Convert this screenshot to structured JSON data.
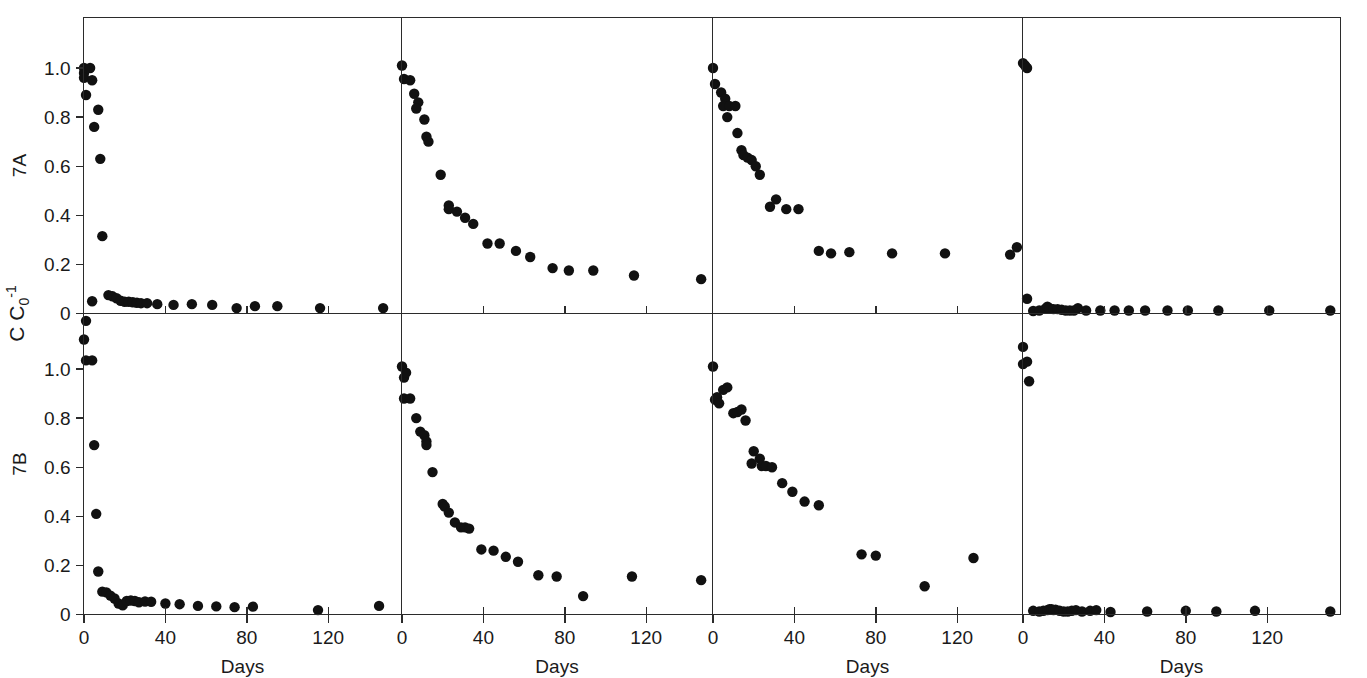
{
  "figure": {
    "y_axis_label": "C C",
    "y_axis_label_sub": "0",
    "y_axis_label_sup": "-1",
    "x_axis_label": "Days",
    "row_labels": [
      "7A",
      "7B"
    ],
    "background_color": "#ffffff",
    "point_color": "#111111",
    "axis_color": "#2b2b2b"
  },
  "chart_data": {
    "type": "scatter",
    "title": "",
    "xlabel": "Days",
    "ylabel": "C C0-1",
    "grid": false,
    "legend": "none",
    "layout": {
      "rows": 2,
      "cols": 4,
      "row_names": [
        "7A",
        "7B"
      ],
      "shared_y_axis": true,
      "shared_x_label": "Days"
    },
    "y_ticks": [
      0,
      0.2,
      0.4,
      0.6,
      0.8,
      1.0
    ],
    "y_tick_labels": [
      "0",
      "0.2",
      "0.4",
      "0.6",
      "0.8",
      "1.0"
    ],
    "ylim": [
      -0.06,
      1.14
    ],
    "x_ticks_panels": [
      [
        0,
        40,
        80,
        120
      ],
      [
        0,
        40,
        80,
        120
      ],
      [
        0,
        40,
        80,
        120
      ],
      [
        0,
        40,
        80,
        120,
        160
      ]
    ],
    "x_tick_labels_panels": [
      [
        "0",
        "40",
        "80",
        "120"
      ],
      [
        "0",
        "40",
        "80",
        "120"
      ],
      [
        "0",
        "40",
        "80",
        "120"
      ],
      [
        "0",
        "40",
        "80",
        "120",
        "160"
      ]
    ],
    "xlim": [
      -4,
      152
    ],
    "panels": [
      {
        "row": "7A",
        "col": 1,
        "points": [
          {
            "x": 0,
            "y": 1.0
          },
          {
            "x": 0,
            "y": 0.98
          },
          {
            "x": 0,
            "y": 0.96
          },
          {
            "x": 1,
            "y": 0.89
          },
          {
            "x": 3,
            "y": 1.0
          },
          {
            "x": 4,
            "y": 0.95
          },
          {
            "x": 7,
            "y": 0.83
          },
          {
            "x": 5,
            "y": 0.76
          },
          {
            "x": 8,
            "y": 0.63
          },
          {
            "x": 9,
            "y": 0.315
          },
          {
            "x": 4,
            "y": 0.05
          },
          {
            "x": 12,
            "y": 0.075
          },
          {
            "x": 14,
            "y": 0.07
          },
          {
            "x": 16,
            "y": 0.062
          },
          {
            "x": 18,
            "y": 0.052
          },
          {
            "x": 20,
            "y": 0.048
          },
          {
            "x": 22,
            "y": 0.048
          },
          {
            "x": 24,
            "y": 0.046
          },
          {
            "x": 26,
            "y": 0.044
          },
          {
            "x": 28,
            "y": 0.042
          },
          {
            "x": 31,
            "y": 0.042
          },
          {
            "x": 36,
            "y": 0.038
          },
          {
            "x": 44,
            "y": 0.035
          },
          {
            "x": 53,
            "y": 0.038
          },
          {
            "x": 63,
            "y": 0.035
          },
          {
            "x": 75,
            "y": 0.022
          },
          {
            "x": 84,
            "y": 0.03
          },
          {
            "x": 95,
            "y": 0.03
          },
          {
            "x": 116,
            "y": 0.022
          },
          {
            "x": 147,
            "y": 0.022
          },
          {
            "x": 1,
            "y": -0.03
          }
        ]
      },
      {
        "row": "7A",
        "col": 2,
        "points": [
          {
            "x": 0,
            "y": 1.01
          },
          {
            "x": 1,
            "y": 0.955
          },
          {
            "x": 4,
            "y": 0.95
          },
          {
            "x": 6,
            "y": 0.895
          },
          {
            "x": 8,
            "y": 0.86
          },
          {
            "x": 7,
            "y": 0.835
          },
          {
            "x": 11,
            "y": 0.79
          },
          {
            "x": 12,
            "y": 0.72
          },
          {
            "x": 13,
            "y": 0.7
          },
          {
            "x": 19,
            "y": 0.565
          },
          {
            "x": 23,
            "y": 0.44
          },
          {
            "x": 23,
            "y": 0.425
          },
          {
            "x": 27,
            "y": 0.415
          },
          {
            "x": 31,
            "y": 0.39
          },
          {
            "x": 35,
            "y": 0.365
          },
          {
            "x": 42,
            "y": 0.285
          },
          {
            "x": 48,
            "y": 0.285
          },
          {
            "x": 56,
            "y": 0.255
          },
          {
            "x": 63,
            "y": 0.23
          },
          {
            "x": 74,
            "y": 0.185
          },
          {
            "x": 82,
            "y": 0.175
          },
          {
            "x": 94,
            "y": 0.175
          },
          {
            "x": 114,
            "y": 0.155
          },
          {
            "x": 147,
            "y": 0.14
          }
        ]
      },
      {
        "row": "7A",
        "col": 3,
        "points": [
          {
            "x": 0,
            "y": 1.0
          },
          {
            "x": 1,
            "y": 0.935
          },
          {
            "x": 4,
            "y": 0.9
          },
          {
            "x": 6,
            "y": 0.875
          },
          {
            "x": 5,
            "y": 0.845
          },
          {
            "x": 8,
            "y": 0.845
          },
          {
            "x": 11,
            "y": 0.845
          },
          {
            "x": 7,
            "y": 0.8
          },
          {
            "x": 12,
            "y": 0.735
          },
          {
            "x": 14,
            "y": 0.665
          },
          {
            "x": 15,
            "y": 0.645
          },
          {
            "x": 17,
            "y": 0.635
          },
          {
            "x": 19,
            "y": 0.625
          },
          {
            "x": 21,
            "y": 0.6
          },
          {
            "x": 23,
            "y": 0.565
          },
          {
            "x": 28,
            "y": 0.435
          },
          {
            "x": 31,
            "y": 0.465
          },
          {
            "x": 36,
            "y": 0.425
          },
          {
            "x": 42,
            "y": 0.425
          },
          {
            "x": 52,
            "y": 0.255
          },
          {
            "x": 58,
            "y": 0.245
          },
          {
            "x": 67,
            "y": 0.25
          },
          {
            "x": 88,
            "y": 0.245
          },
          {
            "x": 114,
            "y": 0.245
          },
          {
            "x": 146,
            "y": 0.24
          }
        ]
      },
      {
        "row": "7A",
        "col": 4,
        "points": [
          {
            "x": 0,
            "y": 1.02
          },
          {
            "x": 1,
            "y": 1.01
          },
          {
            "x": 2,
            "y": 1.0
          },
          {
            "x": -3,
            "y": 0.27
          },
          {
            "x": 2,
            "y": 0.06
          },
          {
            "x": 5,
            "y": 0.01
          },
          {
            "x": 8,
            "y": 0.012
          },
          {
            "x": 11,
            "y": 0.02
          },
          {
            "x": 12,
            "y": 0.028
          },
          {
            "x": 13,
            "y": 0.022
          },
          {
            "x": 15,
            "y": 0.018
          },
          {
            "x": 17,
            "y": 0.018
          },
          {
            "x": 19,
            "y": 0.015
          },
          {
            "x": 21,
            "y": 0.012
          },
          {
            "x": 23,
            "y": 0.012
          },
          {
            "x": 25,
            "y": 0.012
          },
          {
            "x": 27,
            "y": 0.022
          },
          {
            "x": 31,
            "y": 0.012
          },
          {
            "x": 38,
            "y": 0.012
          },
          {
            "x": 45,
            "y": 0.012
          },
          {
            "x": 52,
            "y": 0.012
          },
          {
            "x": 60,
            "y": 0.012
          },
          {
            "x": 71,
            "y": 0.012
          },
          {
            "x": 81,
            "y": 0.012
          },
          {
            "x": 96,
            "y": 0.012
          },
          {
            "x": 121,
            "y": 0.012
          },
          {
            "x": 151,
            "y": 0.012
          }
        ]
      },
      {
        "row": "7B",
        "col": 1,
        "points": [
          {
            "x": 0,
            "y": 1.12
          },
          {
            "x": 1,
            "y": 1.035
          },
          {
            "x": 4,
            "y": 1.035
          },
          {
            "x": 5,
            "y": 0.69
          },
          {
            "x": 6,
            "y": 0.41
          },
          {
            "x": 7,
            "y": 0.175
          },
          {
            "x": 9,
            "y": 0.093
          },
          {
            "x": 11,
            "y": 0.09
          },
          {
            "x": 13,
            "y": 0.077
          },
          {
            "x": 15,
            "y": 0.065
          },
          {
            "x": 17,
            "y": 0.045
          },
          {
            "x": 19,
            "y": 0.037
          },
          {
            "x": 21,
            "y": 0.055
          },
          {
            "x": 23,
            "y": 0.057
          },
          {
            "x": 25,
            "y": 0.055
          },
          {
            "x": 27,
            "y": 0.05
          },
          {
            "x": 30,
            "y": 0.053
          },
          {
            "x": 33,
            "y": 0.052
          },
          {
            "x": 40,
            "y": 0.045
          },
          {
            "x": 47,
            "y": 0.042
          },
          {
            "x": 56,
            "y": 0.035
          },
          {
            "x": 65,
            "y": 0.033
          },
          {
            "x": 74,
            "y": 0.03
          },
          {
            "x": 83,
            "y": 0.032
          },
          {
            "x": 115,
            "y": 0.018
          },
          {
            "x": 145,
            "y": 0.035
          }
        ]
      },
      {
        "row": "7B",
        "col": 2,
        "points": [
          {
            "x": 0,
            "y": 1.01
          },
          {
            "x": 1,
            "y": 0.965
          },
          {
            "x": 2,
            "y": 0.985
          },
          {
            "x": 1,
            "y": 0.88
          },
          {
            "x": 4,
            "y": 0.88
          },
          {
            "x": 7,
            "y": 0.8
          },
          {
            "x": 9,
            "y": 0.745
          },
          {
            "x": 11,
            "y": 0.73
          },
          {
            "x": 12,
            "y": 0.705
          },
          {
            "x": 12,
            "y": 0.69
          },
          {
            "x": 15,
            "y": 0.58
          },
          {
            "x": 20,
            "y": 0.45
          },
          {
            "x": 21,
            "y": 0.44
          },
          {
            "x": 23,
            "y": 0.415
          },
          {
            "x": 26,
            "y": 0.375
          },
          {
            "x": 29,
            "y": 0.355
          },
          {
            "x": 31,
            "y": 0.355
          },
          {
            "x": 33,
            "y": 0.35
          },
          {
            "x": 39,
            "y": 0.265
          },
          {
            "x": 45,
            "y": 0.26
          },
          {
            "x": 51,
            "y": 0.235
          },
          {
            "x": 57,
            "y": 0.215
          },
          {
            "x": 67,
            "y": 0.16
          },
          {
            "x": 76,
            "y": 0.155
          },
          {
            "x": 89,
            "y": 0.075
          },
          {
            "x": 113,
            "y": 0.155
          },
          {
            "x": 147,
            "y": 0.14
          }
        ]
      },
      {
        "row": "7B",
        "col": 3,
        "points": [
          {
            "x": 0,
            "y": 1.01
          },
          {
            "x": 2,
            "y": 0.885
          },
          {
            "x": 5,
            "y": 0.915
          },
          {
            "x": 7,
            "y": 0.925
          },
          {
            "x": 1,
            "y": 0.875
          },
          {
            "x": 3,
            "y": 0.86
          },
          {
            "x": 10,
            "y": 0.82
          },
          {
            "x": 12,
            "y": 0.825
          },
          {
            "x": 14,
            "y": 0.835
          },
          {
            "x": 16,
            "y": 0.79
          },
          {
            "x": 20,
            "y": 0.665
          },
          {
            "x": 23,
            "y": 0.635
          },
          {
            "x": 19,
            "y": 0.615
          },
          {
            "x": 24,
            "y": 0.605
          },
          {
            "x": 26,
            "y": 0.605
          },
          {
            "x": 29,
            "y": 0.6
          },
          {
            "x": 34,
            "y": 0.535
          },
          {
            "x": 39,
            "y": 0.5
          },
          {
            "x": 45,
            "y": 0.46
          },
          {
            "x": 52,
            "y": 0.445
          },
          {
            "x": 73,
            "y": 0.245
          },
          {
            "x": 80,
            "y": 0.24
          },
          {
            "x": 104,
            "y": 0.115
          },
          {
            "x": 128,
            "y": 0.23
          }
        ]
      },
      {
        "row": "7B",
        "col": 4,
        "points": [
          {
            "x": 0,
            "y": 1.09
          },
          {
            "x": 0,
            "y": 1.02
          },
          {
            "x": 2,
            "y": 1.03
          },
          {
            "x": 3,
            "y": 0.95
          },
          {
            "x": 5,
            "y": 0.015
          },
          {
            "x": 8,
            "y": 0.012
          },
          {
            "x": 10,
            "y": 0.015
          },
          {
            "x": 12,
            "y": 0.018
          },
          {
            "x": 13,
            "y": 0.022
          },
          {
            "x": 14,
            "y": 0.022
          },
          {
            "x": 15,
            "y": 0.018
          },
          {
            "x": 16,
            "y": 0.02
          },
          {
            "x": 18,
            "y": 0.015
          },
          {
            "x": 20,
            "y": 0.012
          },
          {
            "x": 22,
            "y": 0.012
          },
          {
            "x": 24,
            "y": 0.015
          },
          {
            "x": 26,
            "y": 0.018
          },
          {
            "x": 29,
            "y": 0.012
          },
          {
            "x": 33,
            "y": 0.015
          },
          {
            "x": 36,
            "y": 0.018
          },
          {
            "x": 43,
            "y": 0.01
          },
          {
            "x": 61,
            "y": 0.012
          },
          {
            "x": 80,
            "y": 0.015
          },
          {
            "x": 95,
            "y": 0.012
          },
          {
            "x": 114,
            "y": 0.015
          },
          {
            "x": 151,
            "y": 0.012
          }
        ]
      }
    ]
  }
}
